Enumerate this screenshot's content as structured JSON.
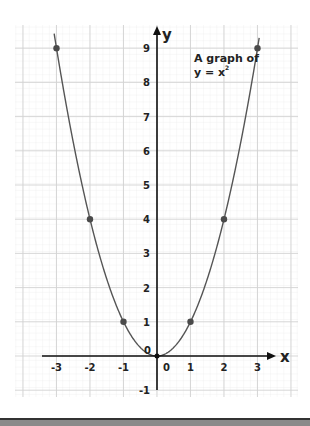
{
  "chart_data": {
    "type": "line",
    "annotation": [
      "A graph of",
      "y = x²"
    ],
    "xlabel": "x",
    "ylabel": "y",
    "x": [
      -3,
      -2,
      -1,
      0,
      1,
      2,
      3
    ],
    "series": [
      {
        "name": "y = x^2",
        "values": [
          9,
          4,
          1,
          0,
          1,
          4,
          9
        ]
      }
    ],
    "marked_points": [
      [
        -3,
        9
      ],
      [
        -2,
        4
      ],
      [
        -1,
        1
      ],
      [
        0,
        0
      ],
      [
        1,
        1
      ],
      [
        2,
        4
      ],
      [
        3,
        9
      ]
    ],
    "xlim": [
      -3.5,
      3.5
    ],
    "ylim": [
      -1,
      9.5
    ],
    "x_ticks": [
      "-3",
      "-2",
      "-1",
      "0",
      "1",
      "2",
      "3"
    ],
    "y_ticks": [
      "-1",
      "0",
      "1",
      "2",
      "3",
      "4",
      "5",
      "6",
      "7",
      "8",
      "9"
    ],
    "grid": true,
    "legend": null,
    "colors": {
      "curve": "#555555",
      "points": "#4a4a4a",
      "axes": "#111111",
      "grid_major": "#cfcfcf",
      "grid_minor": "#ececec"
    }
  },
  "labels": {
    "annotation_line1": "A graph of",
    "annotation_line2": "y = x",
    "annotation_exp": "2",
    "x_axis": "x",
    "y_axis": "y",
    "origin_label_left": "0",
    "origin_label_below": "0",
    "x_tick_labels": [
      "-3",
      "-2",
      "-1",
      "1",
      "2",
      "3"
    ],
    "y_tick_labels": [
      "9",
      "8",
      "7",
      "6",
      "5",
      "4",
      "3",
      "2",
      "1",
      "-1"
    ]
  }
}
